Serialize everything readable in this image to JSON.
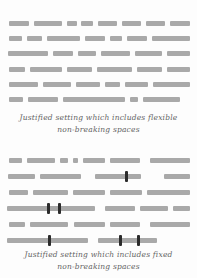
{
  "figure": {
    "bar_color": "#a9a9a9",
    "marker_color": "#2b2b2b",
    "caption_color": "#636363",
    "background_color": "#fdfdfd",
    "blocks": [
      {
        "id": "flexible",
        "caption_lines": [
          "Justified setting which includes flexible",
          "non-breaking spaces"
        ],
        "top": 21,
        "row_pitch": 15.2,
        "caption_top": 112,
        "rows": [
          {
            "segments": [
              [
                9,
                20
              ],
              [
                34,
                28
              ],
              [
                67,
                10
              ],
              [
                81,
                12
              ],
              [
                98,
                19
              ],
              [
                122,
                19
              ],
              [
                146,
                19
              ],
              [
                170,
                20
              ]
            ],
            "markers": []
          },
          {
            "segments": [
              [
                9,
                13
              ],
              [
                27,
                15
              ],
              [
                47,
                33
              ],
              [
                85,
                20
              ],
              [
                110,
                12
              ],
              [
                127,
                20
              ],
              [
                152,
                38
              ]
            ],
            "markers": []
          },
          {
            "segments": [
              [
                8,
                40
              ],
              [
                53,
                20
              ],
              [
                78,
                18
              ],
              [
                101,
                29
              ],
              [
                135,
                27
              ],
              [
                167,
                23
              ]
            ],
            "markers": []
          },
          {
            "segments": [
              [
                9,
                16
              ],
              [
                30,
                32
              ],
              [
                67,
                25
              ],
              [
                97,
                35
              ],
              [
                137,
                25
              ],
              [
                167,
                23
              ]
            ],
            "markers": []
          },
          {
            "segments": [
              [
                9,
                29
              ],
              [
                43,
                28
              ],
              [
                76,
                24
              ],
              [
                105,
                15
              ],
              [
                125,
                23
              ],
              [
                153,
                37
              ]
            ],
            "markers": []
          },
          {
            "segments": [
              [
                9,
                14
              ],
              [
                28,
                30
              ],
              [
                63,
                62
              ],
              [
                130,
                8
              ],
              [
                143,
                37
              ]
            ],
            "markers": []
          }
        ]
      },
      {
        "id": "fixed",
        "caption_lines": [
          "Justified setting which includes fixed",
          "non-breaking spaces"
        ],
        "top": 158,
        "row_pitch": 15.9,
        "caption_top": 249,
        "rows": [
          {
            "segments": [
              [
                9,
                13
              ],
              [
                27,
                28
              ],
              [
                60,
                8
              ],
              [
                73,
                5
              ],
              [
                83,
                22
              ],
              [
                110,
                30
              ],
              [
                150,
                40
              ]
            ],
            "markers": []
          },
          {
            "segments": [
              [
                8,
                27
              ],
              [
                40,
                41
              ],
              [
                95,
                46
              ],
              [
                164,
                26
              ]
            ],
            "markers": [
              125
            ]
          },
          {
            "segments": [
              [
                9,
                19
              ],
              [
                33,
                35
              ],
              [
                73,
                32
              ],
              [
                110,
                32
              ],
              [
                147,
                43
              ]
            ],
            "markers": []
          },
          {
            "segments": [
              [
                7,
                88
              ],
              [
                105,
                30
              ],
              [
                140,
                28
              ],
              [
                173,
                17
              ]
            ],
            "markers": [
              47,
              58
            ]
          },
          {
            "segments": [
              [
                9,
                16
              ],
              [
                30,
                38
              ],
              [
                74,
                31
              ],
              [
                110,
                30
              ],
              [
                150,
                40
              ]
            ],
            "markers": []
          },
          {
            "segments": [
              [
                7,
                81
              ],
              [
                98,
                59
              ]
            ],
            "markers": [
              48,
              119,
              137
            ]
          }
        ]
      }
    ]
  }
}
